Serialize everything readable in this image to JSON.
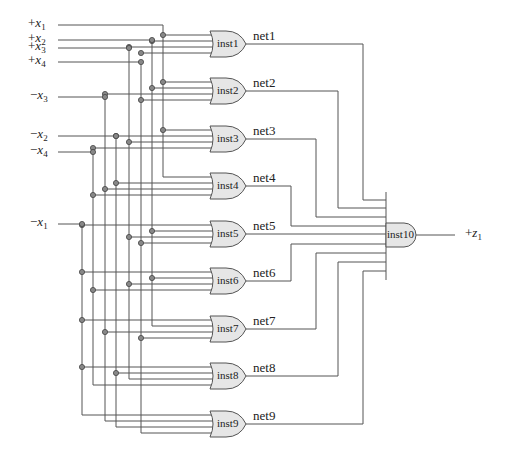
{
  "inputs": [
    {
      "id": "px1",
      "sign": "+",
      "var": "x",
      "sub": "1",
      "y": 25,
      "bus_x": 163
    },
    {
      "id": "px2",
      "sign": "+",
      "var": "x",
      "sub": "2",
      "y": 40,
      "bus_x": 152
    },
    {
      "id": "px3",
      "sign": "+",
      "var": "x",
      "sub": "3",
      "y": 48,
      "bus_x": 129
    },
    {
      "id": "px4",
      "sign": "+",
      "var": "x",
      "sub": "4",
      "y": 62,
      "bus_x": 141
    },
    {
      "id": "nx3",
      "sign": "−",
      "var": "x",
      "sub": "3",
      "y": 97,
      "bus_x": 105
    },
    {
      "id": "nx2",
      "sign": "−",
      "var": "x",
      "sub": "2",
      "y": 136,
      "bus_x": 116
    },
    {
      "id": "nx4",
      "sign": "−",
      "var": "x",
      "sub": "4",
      "y": 152,
      "bus_x": 93
    },
    {
      "id": "nx1",
      "sign": "−",
      "var": "x",
      "sub": "1",
      "y": 224,
      "bus_x": 82
    }
  ],
  "or_gates": [
    {
      "name": "inst1",
      "net": "net1",
      "cy": 44,
      "inputs": [
        "px1",
        "px2",
        "px3",
        "px4"
      ]
    },
    {
      "name": "inst2",
      "net": "net2",
      "cy": 91,
      "inputs": [
        "px1",
        "px2",
        "nx3",
        "px4"
      ]
    },
    {
      "name": "inst3",
      "net": "net3",
      "cy": 139,
      "inputs": [
        "px1",
        "nx2",
        "px3",
        "nx4"
      ]
    },
    {
      "name": "inst4",
      "net": "net4",
      "cy": 186,
      "inputs": [
        "px1",
        "nx2",
        "nx3",
        "nx4"
      ]
    },
    {
      "name": "inst5",
      "net": "net5",
      "cy": 234,
      "inputs": [
        "nx1",
        "px2",
        "px3",
        "px4"
      ]
    },
    {
      "name": "inst6",
      "net": "net6",
      "cy": 281,
      "inputs": [
        "nx1",
        "px2",
        "px3",
        "nx4"
      ]
    },
    {
      "name": "inst7",
      "net": "net7",
      "cy": 329,
      "inputs": [
        "nx1",
        "px2",
        "nx3",
        "px4"
      ]
    },
    {
      "name": "inst8",
      "net": "net8",
      "cy": 376,
      "inputs": [
        "nx1",
        "nx2",
        "px3",
        "nx4"
      ]
    },
    {
      "name": "inst9",
      "net": "net9",
      "cy": 424,
      "inputs": [
        "nx1",
        "nx3",
        "nx2",
        "px4"
      ]
    }
  ],
  "and_gate": {
    "name": "inst10",
    "output": {
      "sign": "+",
      "var": "z",
      "sub": "1"
    }
  },
  "colors": {
    "wire": "#555555",
    "gate_fill": "#e6e6e6",
    "gate_stroke": "#555555",
    "dot_fill": "#888888"
  }
}
